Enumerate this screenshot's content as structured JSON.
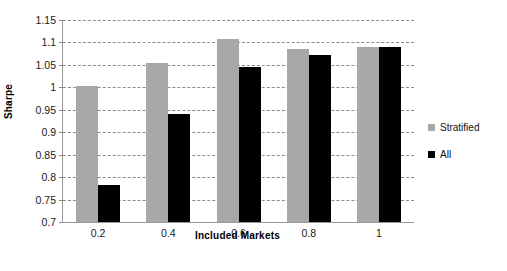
{
  "chart_data": {
    "type": "bar",
    "title": "",
    "xlabel": "Included Markets",
    "ylabel": "Sharpe",
    "categories": [
      "0.2",
      "0.4",
      "0.6",
      "0.8",
      "1"
    ],
    "series": [
      {
        "name": "Stratified",
        "color": "#a8a8a8",
        "values": [
          1.003,
          1.055,
          1.108,
          1.085,
          1.09
        ]
      },
      {
        "name": "All",
        "color": "#000000",
        "values": [
          0.783,
          0.94,
          1.046,
          1.073,
          1.09
        ]
      }
    ],
    "ylim": [
      0.7,
      1.15
    ],
    "ytick_labels": [
      "1.15",
      "1.1",
      "1.05",
      "1",
      "0.95",
      "0.9",
      "0.85",
      "0.8",
      "0.75",
      "0.7"
    ],
    "ytick_values": [
      1.15,
      1.1,
      1.05,
      1.0,
      0.95,
      0.9,
      0.85,
      0.8,
      0.75,
      0.7
    ],
    "grid": true,
    "grid_style": "dashed-horizontal",
    "legend_position": "right",
    "legend": [
      "Stratified",
      "All"
    ],
    "background": "#ffffff"
  }
}
